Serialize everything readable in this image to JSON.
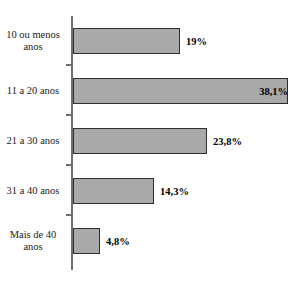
{
  "figure": {
    "top_clipped_text": "",
    "background_color": "#ffffff",
    "bar_fill_color": "#a9a9a9",
    "bar_border_color": "#2e2e2e",
    "axis_color": "#6f6f6f",
    "value_text_color": "#000000",
    "label_text_color": "#1b1b1b"
  },
  "chart_data": {
    "type": "bar",
    "orientation": "horizontal",
    "title": "",
    "xlabel": "",
    "ylabel": "",
    "grid": false,
    "legend": false,
    "xlim": [
      0,
      38.1
    ],
    "categories": [
      "10 ou menos anos",
      "11 a 20 anos",
      "21 a 30 anos",
      "31 a 40 anos",
      "Mais de 40 anos"
    ],
    "values": [
      19.0,
      38.1,
      23.8,
      14.3,
      4.8
    ],
    "value_labels": [
      "19%",
      "38,1%",
      "23,8%",
      "14,3%",
      "4,8%"
    ],
    "label_position": [
      "outside",
      "inside",
      "outside",
      "outside",
      "outside"
    ]
  }
}
